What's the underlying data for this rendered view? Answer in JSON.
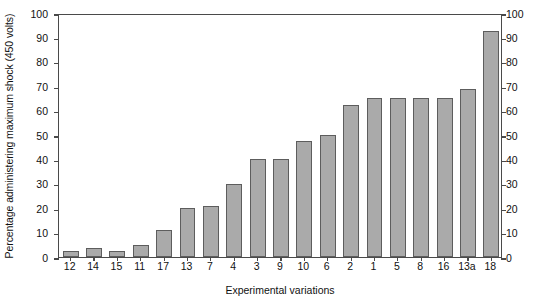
{
  "chart_data": {
    "type": "bar",
    "title": "",
    "xlabel": "Experimental variations",
    "ylabel": "Percentage administering maximum shock (450 volts)",
    "ylabel_right": "",
    "categories": [
      "12",
      "14",
      "15",
      "11",
      "17",
      "13",
      "7",
      "4",
      "3",
      "9",
      "10",
      "6",
      "2",
      "1",
      "5",
      "8",
      "16",
      "13a",
      "18"
    ],
    "values": [
      2.5,
      3.5,
      2.5,
      5,
      11,
      20,
      21,
      30,
      40,
      40,
      47.5,
      50,
      62.5,
      65,
      65,
      65,
      65,
      69,
      92.5
    ],
    "ylim": [
      0,
      100
    ],
    "ytick_values": [
      0,
      10,
      20,
      30,
      40,
      50,
      60,
      70,
      80,
      90,
      100
    ],
    "ytick_labels": [
      "0",
      "10",
      "20",
      "30",
      "40",
      "50",
      "60",
      "70",
      "80",
      "90",
      "100"
    ],
    "right_axis": true,
    "right_ytick_labels": [
      "0",
      "10",
      "20",
      "30",
      "40",
      "50",
      "60",
      "70",
      "80",
      "90",
      "100"
    ],
    "grid": false,
    "legend": null,
    "bar_color": "#aaaaaa",
    "bar_edge_color": "#5d5d5d",
    "axis_color": "#4a4a4a",
    "background": "#ffffff"
  }
}
